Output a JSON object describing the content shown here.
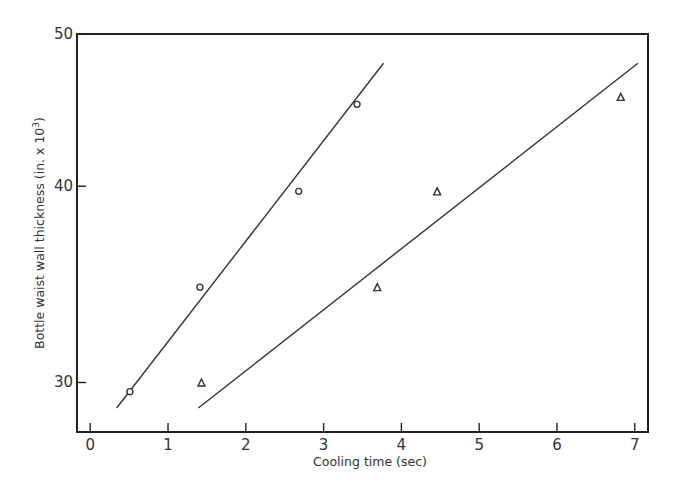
{
  "chart_data": {
    "type": "scatter",
    "title": "",
    "xlabel": "Cooling time (sec)",
    "ylabel": "Bottle waist wall thickness (in. x 10",
    "ylabel_superscript": "3",
    "ylabel_suffix": ")",
    "xlim": [
      -0.17,
      7.17
    ],
    "ylim": [
      27.9,
      50
    ],
    "yscale": "log",
    "grid": false,
    "legend": "none",
    "x_ticks": [
      0,
      1,
      2,
      3,
      4,
      5,
      6,
      7
    ],
    "x_tick_labels": [
      "0",
      "1",
      "2",
      "3",
      "4",
      "5",
      "6",
      "7"
    ],
    "y_ticks": [
      30,
      40,
      50
    ],
    "y_tick_labels": [
      "30",
      "40",
      "50"
    ],
    "series": [
      {
        "name": "circles",
        "marker": "circle",
        "points": [
          {
            "x": 0.51,
            "y": 29.6
          },
          {
            "x": 1.41,
            "y": 34.5
          },
          {
            "x": 2.68,
            "y": 39.7
          },
          {
            "x": 3.43,
            "y": 45.1
          }
        ],
        "fit_line": {
          "x": [
            0.34,
            3.77
          ],
          "y": [
            28.9,
            47.9
          ]
        }
      },
      {
        "name": "triangles",
        "marker": "triangle",
        "points": [
          {
            "x": 1.43,
            "y": 30.0
          },
          {
            "x": 3.69,
            "y": 34.5
          },
          {
            "x": 4.46,
            "y": 39.7
          },
          {
            "x": 6.82,
            "y": 45.6
          }
        ],
        "fit_line": {
          "x": [
            1.39,
            7.04
          ],
          "y": [
            28.9,
            47.9
          ]
        }
      }
    ]
  }
}
